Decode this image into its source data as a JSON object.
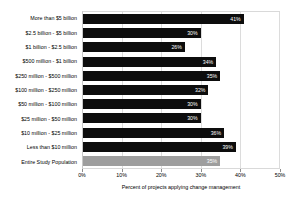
{
  "chart_data": {
    "type": "bar",
    "orientation": "horizontal",
    "title": "",
    "xlabel": "Percent of projects applying change management",
    "ylabel": "",
    "xlim": [
      0,
      50
    ],
    "xticks": [
      "0%",
      "10%",
      "20%",
      "30%",
      "40%",
      "50%"
    ],
    "xtick_values": [
      0,
      10,
      20,
      30,
      40,
      50
    ],
    "grid": true,
    "legend": "none",
    "value_suffix": "%",
    "categories": [
      "More than $5 billion",
      "$2.5 billion - $5 billion",
      "$1 billion - $2.5 billion",
      "$500 million - $1 billion",
      "$250 million - $500 million",
      "$100 million - $250 million",
      "$50 million - $100 million",
      "$25 million - $50 million",
      "$10 million - $25 million",
      "Less than $10 million",
      "Entire Study Population"
    ],
    "values": [
      41,
      30,
      26,
      34,
      35,
      32,
      30,
      30,
      36,
      39,
      35
    ],
    "value_labels": [
      "41%",
      "30%",
      "26%",
      "34%",
      "35%",
      "32%",
      "30%",
      "30%",
      "36%",
      "39%",
      "35%"
    ],
    "bar_colors": [
      "#0d0d0d",
      "#0d0d0d",
      "#0d0d0d",
      "#0d0d0d",
      "#0d0d0d",
      "#0d0d0d",
      "#0d0d0d",
      "#0d0d0d",
      "#0d0d0d",
      "#0d0d0d",
      "#9e9e9e"
    ],
    "highlight_index": 10,
    "colors": {
      "bar": "#0d0d0d",
      "highlight_bar": "#9e9e9e",
      "value_label": "#ffffff",
      "gridline": "#dcdcdc",
      "axis": "#8c8c8c",
      "background": "#ffffff"
    }
  }
}
